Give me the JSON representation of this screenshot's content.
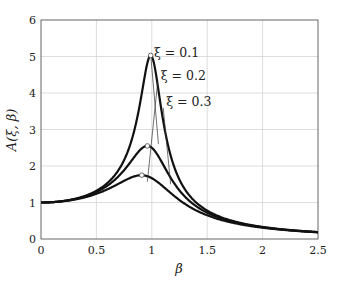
{
  "chart_data": {
    "type": "line",
    "title": "",
    "xlabel": "β",
    "ylabel": "A(ξ, β)",
    "xlim": [
      0,
      2.5
    ],
    "ylim": [
      0,
      6
    ],
    "grid": true,
    "legend": "none (inline leader-line annotations)",
    "x_ticks": [
      0,
      0.5,
      1,
      1.5,
      2,
      2.5
    ],
    "x_tick_labels": [
      "0",
      "0.5",
      "1",
      "1.5",
      "2",
      "2.5"
    ],
    "y_ticks": [
      0,
      1,
      2,
      3,
      4,
      5,
      6
    ],
    "y_tick_labels": [
      "0",
      "1",
      "2",
      "3",
      "4",
      "5",
      "6"
    ],
    "x": [
      0,
      0.1,
      0.2,
      0.3,
      0.4,
      0.5,
      0.6,
      0.7,
      0.8,
      0.85,
      0.9,
      0.95,
      1.0,
      1.05,
      1.1,
      1.15,
      1.2,
      1.3,
      1.4,
      1.5,
      1.6,
      1.7,
      1.8,
      1.9,
      2.0,
      2.1,
      2.2,
      2.3,
      2.4,
      2.5
    ],
    "series": [
      {
        "name": "ξ = 0.1",
        "xi": 0.1,
        "values": [
          1.0,
          1.01,
          1.04,
          1.099,
          1.187,
          1.326,
          1.547,
          1.917,
          2.587,
          3.111,
          3.821,
          4.649,
          5.0,
          4.459,
          3.512,
          2.702,
          2.118,
          1.4,
          1.005,
          0.771,
          0.62,
          0.511,
          0.431,
          0.368,
          0.318,
          0.278,
          0.245,
          0.218,
          0.196,
          0.176
        ],
        "peak": {
          "x": 0.99,
          "y": 5.03
        }
      },
      {
        "name": "ξ = 0.2",
        "xi": 0.2,
        "values": [
          1.0,
          1.009,
          1.038,
          1.089,
          1.166,
          1.281,
          1.445,
          1.683,
          2.006,
          2.187,
          2.372,
          2.507,
          2.5,
          2.345,
          2.091,
          1.826,
          1.58,
          1.194,
          0.925,
          0.745,
          0.613,
          0.511,
          0.433,
          0.369,
          0.318,
          0.278,
          0.245,
          0.218,
          0.195,
          0.175
        ],
        "peak": {
          "x": 0.96,
          "y": 2.55
        }
      },
      {
        "name": "ξ = 0.3",
        "xi": 0.3,
        "values": [
          1.0,
          1.008,
          1.033,
          1.074,
          1.136,
          1.222,
          1.335,
          1.474,
          1.62,
          1.684,
          1.733,
          1.741,
          1.667,
          1.573,
          1.454,
          1.334,
          1.218,
          1.013,
          0.843,
          0.708,
          0.599,
          0.51,
          0.436,
          0.375,
          0.325,
          0.284,
          0.25,
          0.222,
          0.198,
          0.178
        ],
        "peak": {
          "x": 0.91,
          "y": 1.75
        }
      }
    ],
    "annotations": [
      {
        "text": "ξ = 0.1",
        "label_pos": [
          1.02,
          5.0
        ],
        "points_to": [
          1.06,
          2.6
        ]
      },
      {
        "text": "ξ = 0.2",
        "label_pos": [
          1.08,
          4.35
        ],
        "points_to": [
          0.96,
          1.57
        ]
      },
      {
        "text": "ξ = 0.3",
        "label_pos": [
          1.13,
          3.65
        ],
        "points_to": [
          1.17,
          1.5
        ]
      }
    ]
  },
  "axes": {
    "xlabel": "β",
    "ylabel": "A(ξ, β)"
  }
}
